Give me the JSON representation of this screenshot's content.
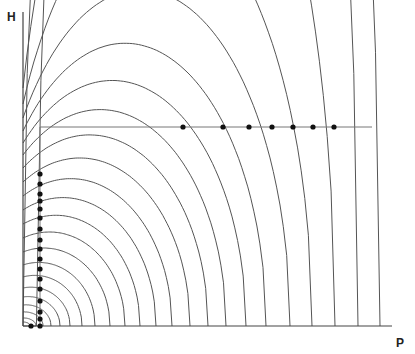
{
  "diagram": {
    "axes": {
      "y_label": "H",
      "x_label": "P"
    },
    "colors": {
      "curve": "#555555",
      "axis": "#444444",
      "dot": "#111111"
    },
    "origin": {
      "x": 23,
      "y": 326
    },
    "y_axis_top": 12,
    "x_axis_right": 392,
    "curves": {
      "count": 20,
      "description": "nested quarter-elliptical curves from H axis down to P axis",
      "x_intercepts": [
        30,
        36,
        43,
        51,
        60,
        70,
        82,
        95,
        110,
        125,
        140,
        156,
        172,
        190,
        208,
        226,
        246,
        266,
        290,
        312,
        335,
        358,
        380
      ],
      "y_intercepts": [
        322,
        318,
        312,
        305,
        297,
        288,
        277,
        265,
        252,
        238,
        224,
        210,
        196,
        182,
        168,
        155,
        143,
        131,
        118,
        104,
        88,
        72,
        56
      ],
      "peak_offsets": [
        0.02,
        0.05,
        0.08,
        0.11,
        0.14,
        0.17,
        0.2,
        0.22,
        0.24,
        0.26,
        0.28,
        0.3,
        0.32,
        0.34,
        0.36,
        0.38,
        0.4,
        0.42,
        0.44,
        0.46,
        0.48,
        0.5,
        0.52
      ]
    },
    "constraint_lines": {
      "horizontal": {
        "y": 127,
        "x_start": 40,
        "x_end": 372
      },
      "vertical": {
        "x": 40,
        "y_start": 127,
        "y_end": 326
      }
    },
    "dots_horizontal": [
      {
        "x": 183,
        "y": 127
      },
      {
        "x": 223,
        "y": 127
      },
      {
        "x": 249,
        "y": 127
      },
      {
        "x": 272,
        "y": 127
      },
      {
        "x": 293,
        "y": 127
      },
      {
        "x": 313,
        "y": 127
      },
      {
        "x": 334,
        "y": 127
      }
    ],
    "dots_vertical": [
      {
        "x": 40,
        "y": 174
      },
      {
        "x": 40,
        "y": 184
      },
      {
        "x": 40,
        "y": 194
      },
      {
        "x": 40,
        "y": 201
      },
      {
        "x": 40,
        "y": 209
      },
      {
        "x": 40,
        "y": 218
      },
      {
        "x": 40,
        "y": 229
      },
      {
        "x": 40,
        "y": 240
      },
      {
        "x": 40,
        "y": 249
      },
      {
        "x": 40,
        "y": 259
      },
      {
        "x": 40,
        "y": 269
      },
      {
        "x": 40,
        "y": 279
      },
      {
        "x": 40,
        "y": 289
      },
      {
        "x": 40,
        "y": 301
      },
      {
        "x": 40,
        "y": 312
      },
      {
        "x": 40,
        "y": 319
      },
      {
        "x": 40,
        "y": 326
      },
      {
        "x": 31,
        "y": 326
      }
    ]
  }
}
